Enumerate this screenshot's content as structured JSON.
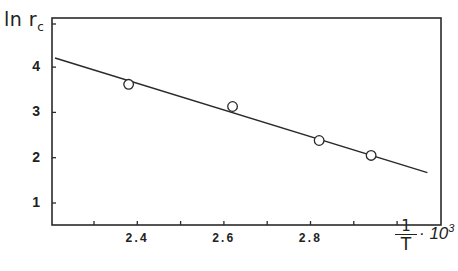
{
  "chart_data": {
    "type": "scatter",
    "title": "",
    "xlabel": "1/T · 10^3",
    "xlabel_parts": {
      "numerator": "1",
      "denominator": "T",
      "multiplier": "· 10",
      "exponent": "3"
    },
    "ylabel": "ln r_c",
    "ylabel_parts": {
      "main": "ln r",
      "sub": "c"
    },
    "xlim": [
      2.2,
      3.1
    ],
    "ylim": [
      0.55,
      5.0
    ],
    "x_ticks": [
      2.3,
      2.4,
      2.5,
      2.6,
      2.7,
      2.8,
      2.9,
      3.0
    ],
    "x_tick_labels": [
      "",
      "2.4",
      "",
      "2.6",
      "",
      "2.8",
      "",
      ""
    ],
    "y_ticks": [
      1,
      2,
      3,
      4
    ],
    "y_tick_labels": [
      "1",
      "2",
      "3",
      "4"
    ],
    "grid": false,
    "legend": null,
    "series": [
      {
        "name": "measured",
        "marker": "open-circle",
        "x": [
          2.38,
          2.62,
          2.82,
          2.94
        ],
        "y": [
          3.62,
          3.13,
          2.38,
          2.05
        ]
      },
      {
        "name": "linear fit",
        "style": "line",
        "x": [
          2.21,
          3.07
        ],
        "y": [
          4.2,
          1.67
        ]
      }
    ]
  }
}
